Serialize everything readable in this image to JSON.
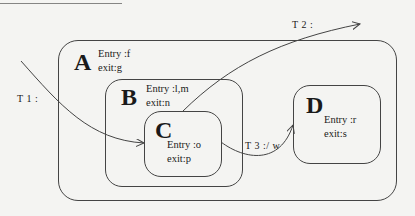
{
  "diagram": {
    "type": "statechart",
    "states": [
      {
        "id": "A",
        "name": "A",
        "entry": "Entry :f",
        "exit": "exit:g"
      },
      {
        "id": "B",
        "name": "B",
        "entry": "Entry :l,m",
        "exit": "exit:n"
      },
      {
        "id": "C",
        "name": "C",
        "entry": "Entry :o",
        "exit": "exit:p"
      },
      {
        "id": "D",
        "name": "D",
        "entry": "Entry :r",
        "exit": "exit:s"
      }
    ],
    "transitions": [
      {
        "id": "T1",
        "label": "T 1 :",
        "from": "outside",
        "to": "C"
      },
      {
        "id": "T2",
        "label": "T 2 :",
        "from": "B",
        "to": "outside"
      },
      {
        "id": "T3",
        "label": "T 3 :/ w",
        "from": "C",
        "to": "D"
      }
    ],
    "colors": {
      "line": "#444444",
      "background": "#f4f4f2",
      "text": "#1a1a1a"
    }
  }
}
